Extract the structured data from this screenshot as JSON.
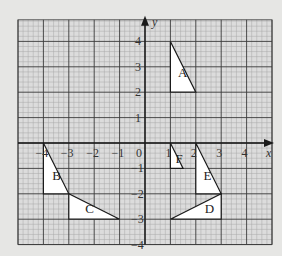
{
  "colors": {
    "background": "#e6e6e4",
    "grid_paper": "#dcdcdc",
    "fine_grid": "#a8a8a8",
    "major_grid": "#3a3a3a",
    "axis": "#1a1a1a",
    "shape_fill": "#ffffff",
    "shape_stroke": "#1a1a1a"
  },
  "axes": {
    "x_label": "x",
    "y_label": "y",
    "x_range": [
      -5,
      5
    ],
    "y_range": [
      -4,
      4.85
    ],
    "x_ticks": [
      {
        "value": -4,
        "label": "-4"
      },
      {
        "value": -3,
        "label": "-3"
      },
      {
        "value": -2,
        "label": "-2"
      },
      {
        "value": -1,
        "label": "-1"
      },
      {
        "value": 1,
        "label": "1"
      },
      {
        "value": 2,
        "label": "2"
      },
      {
        "value": 3,
        "label": "3"
      },
      {
        "value": 4,
        "label": "4"
      }
    ],
    "y_ticks": [
      {
        "value": 4,
        "label": "4"
      },
      {
        "value": 3,
        "label": "3"
      },
      {
        "value": 2,
        "label": "2"
      },
      {
        "value": 1,
        "label": "1"
      },
      {
        "value": -1,
        "label": "-1"
      },
      {
        "value": -2,
        "label": "-2"
      },
      {
        "value": -3,
        "label": "-3"
      },
      {
        "value": -4,
        "label": "-4"
      }
    ],
    "origin_label": "0"
  },
  "shapes": [
    {
      "label": "A",
      "points": [
        [
          1,
          4
        ],
        [
          1,
          2
        ],
        [
          2,
          2
        ]
      ],
      "label_pos": [
        1.3,
        2.6
      ]
    },
    {
      "label": "B",
      "points": [
        [
          -4,
          0
        ],
        [
          -4,
          -2
        ],
        [
          -3,
          -2
        ]
      ],
      "label_pos": [
        -3.65,
        -1.45
      ]
    },
    {
      "label": "C",
      "points": [
        [
          -3,
          -2
        ],
        [
          -3,
          -3
        ],
        [
          -1,
          -3
        ]
      ],
      "label_pos": [
        -2.35,
        -2.75
      ]
    },
    {
      "label": "D",
      "points": [
        [
          1,
          -3
        ],
        [
          3,
          -3
        ],
        [
          3,
          -2
        ]
      ],
      "label_pos": [
        2.35,
        -2.75
      ]
    },
    {
      "label": "E",
      "points": [
        [
          2,
          0
        ],
        [
          2,
          -2
        ],
        [
          3,
          -2
        ]
      ],
      "label_pos": [
        2.3,
        -1.45
      ]
    },
    {
      "label": "F",
      "points": [
        [
          1,
          0
        ],
        [
          1,
          -1
        ],
        [
          1.5,
          -1
        ]
      ],
      "label_pos": [
        1.2,
        -0.8
      ]
    }
  ]
}
